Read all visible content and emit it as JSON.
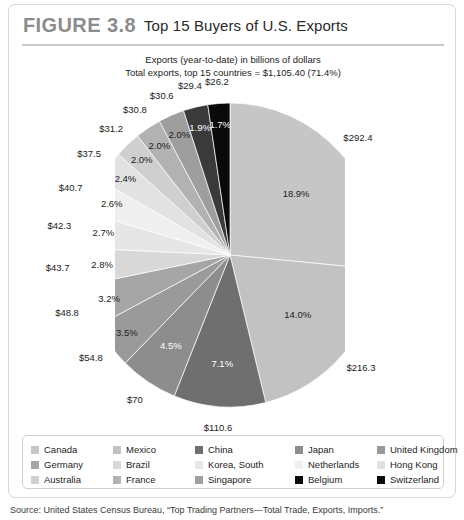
{
  "figure": {
    "number": "FIGURE 3.8",
    "title": "Top 15 Buyers of U.S. Exports",
    "subtitle_line1": "Exports (year-to-date) in billions of dollars",
    "subtitle_line2": "Total exports, top 15 countries = $1,105.40 (71.4%)",
    "source": "Source: United States Census Bureau, “Top Trading Partners—Total Trade, Exports, Imports.”"
  },
  "chart_data": {
    "type": "pie",
    "title": "Top 15 Buyers of U.S. Exports",
    "subtitle": "Exports (year-to-date) in billions of dollars",
    "total_label": "Total exports, top 15 countries = $1,105.40 (71.4%)",
    "total_value": 1105.4,
    "total_share_pct": 71.4,
    "unit": "billions of dollars",
    "start_angle_deg": 0,
    "direction": "clockwise",
    "legend_position": "bottom",
    "legend_columns": 5,
    "labels": [
      "Canada",
      "Mexico",
      "China",
      "Japan",
      "United Kingdom",
      "Germany",
      "Brazil",
      "Korea, South",
      "Netherlands",
      "Hong Kong",
      "Australia",
      "France",
      "Singapore",
      "Belgium",
      "Switzerland"
    ],
    "values": [
      292.4,
      216.3,
      110.6,
      70.0,
      54.8,
      48.8,
      43.7,
      42.3,
      40.7,
      37.5,
      31.2,
      30.8,
      30.6,
      29.4,
      26.2
    ],
    "value_labels": [
      "$292.4",
      "$216.3",
      "$110.6",
      "$70",
      "$54.8",
      "$48.8",
      "$43.7",
      "$42.3",
      "$40.7",
      "$37.5",
      "$31.2",
      "$30.8",
      "$30.6",
      "$29.4",
      "$26.2"
    ],
    "percent_labels": [
      "18.9%",
      "14.0%",
      "7.1%",
      "4.5%",
      "3.5%",
      "3.2%",
      "2.8%",
      "2.7%",
      "2.6%",
      "2.4%",
      "2.0%",
      "2.0%",
      "2.0%",
      "1.9%",
      "1.7%"
    ],
    "percents": [
      18.9,
      14.0,
      7.1,
      4.5,
      3.5,
      3.2,
      2.8,
      2.7,
      2.6,
      2.4,
      2.0,
      2.0,
      2.0,
      1.9,
      1.7
    ],
    "colors": [
      "#c6c6c6",
      "#c2c2c2",
      "#6f6f6f",
      "#8d8d8d",
      "#9a9a9a",
      "#a6a6a6",
      "#d8d8d8",
      "#e6e6e6",
      "#efefef",
      "#e2e2e2",
      "#cfcfcf",
      "#b2b2b2",
      "#9e9e9e",
      "#3a3a3a",
      "#0a0a0a"
    ],
    "slices": [
      {
        "label": "Canada",
        "value": 292.4,
        "value_label": "$292.4",
        "percent": 18.9,
        "percent_label": "18.9%",
        "color": "#c6c6c6"
      },
      {
        "label": "Mexico",
        "value": 216.3,
        "value_label": "$216.3",
        "percent": 14.0,
        "percent_label": "14.0%",
        "color": "#c2c2c2"
      },
      {
        "label": "China",
        "value": 110.6,
        "value_label": "$110.6",
        "percent": 7.1,
        "percent_label": "7.1%",
        "color": "#6f6f6f"
      },
      {
        "label": "Japan",
        "value": 70.0,
        "value_label": "$70",
        "percent": 4.5,
        "percent_label": "4.5%",
        "color": "#8d8d8d"
      },
      {
        "label": "United Kingdom",
        "value": 54.8,
        "value_label": "$54.8",
        "percent": 3.5,
        "percent_label": "3.5%",
        "color": "#9a9a9a"
      },
      {
        "label": "Germany",
        "value": 48.8,
        "value_label": "$48.8",
        "percent": 3.2,
        "percent_label": "3.2%",
        "color": "#a6a6a6"
      },
      {
        "label": "Brazil",
        "value": 43.7,
        "value_label": "$43.7",
        "percent": 2.8,
        "percent_label": "2.8%",
        "color": "#d8d8d8"
      },
      {
        "label": "Korea, South",
        "value": 42.3,
        "value_label": "$42.3",
        "percent": 2.7,
        "percent_label": "2.7%",
        "color": "#e6e6e6"
      },
      {
        "label": "Netherlands",
        "value": 40.7,
        "value_label": "$40.7",
        "percent": 2.6,
        "percent_label": "2.6%",
        "color": "#efefef"
      },
      {
        "label": "Hong Kong",
        "value": 37.5,
        "value_label": "$37.5",
        "percent": 2.4,
        "percent_label": "2.4%",
        "color": "#e2e2e2"
      },
      {
        "label": "Australia",
        "value": 31.2,
        "value_label": "$31.2",
        "percent": 2.0,
        "percent_label": "2.0%",
        "color": "#cfcfcf"
      },
      {
        "label": "France",
        "value": 30.8,
        "value_label": "$30.8",
        "percent": 2.0,
        "percent_label": "2.0%",
        "color": "#b2b2b2"
      },
      {
        "label": "Singapore",
        "value": 30.6,
        "value_label": "$30.6",
        "percent": 2.0,
        "percent_label": "2.0%",
        "color": "#9e9e9e"
      },
      {
        "label": "Belgium",
        "value": 29.4,
        "value_label": "$29.4",
        "percent": 1.9,
        "percent_label": "1.9%",
        "color": "#3a3a3a"
      },
      {
        "label": "Switzerland",
        "value": 26.2,
        "value_label": "$26.2",
        "percent": 1.7,
        "percent_label": "1.7%",
        "color": "#0a0a0a"
      }
    ]
  },
  "legend": {
    "items": [
      {
        "label": "Canada",
        "color": "#c6c6c6"
      },
      {
        "label": "Mexico",
        "color": "#c2c2c2"
      },
      {
        "label": "China",
        "color": "#6f6f6f"
      },
      {
        "label": "Japan",
        "color": "#8d8d8d"
      },
      {
        "label": "United Kingdom",
        "color": "#9a9a9a"
      },
      {
        "label": "Germany",
        "color": "#a6a6a6"
      },
      {
        "label": "Brazil",
        "color": "#d8d8d8"
      },
      {
        "label": "Korea, South",
        "color": "#e6e6e6"
      },
      {
        "label": "Netherlands",
        "color": "#efefef"
      },
      {
        "label": "Hong Kong",
        "color": "#e2e2e2"
      },
      {
        "label": "Australia",
        "color": "#cfcfcf"
      },
      {
        "label": "France",
        "color": "#b2b2b2"
      },
      {
        "label": "Singapore",
        "color": "#9e9e9e"
      },
      {
        "label": "Belgium",
        "color": "#0a0a0a"
      },
      {
        "label": "Switzerland",
        "color": "#0a0a0a"
      }
    ]
  }
}
